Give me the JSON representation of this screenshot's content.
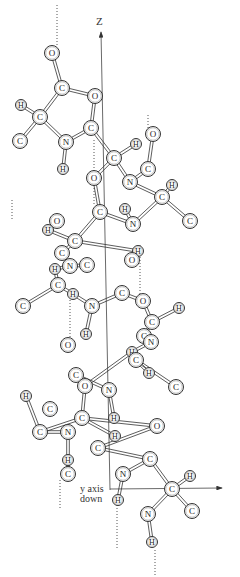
{
  "figure": {
    "type": "alpha-helix ball-and-stick diagram",
    "axes": {
      "z_label": "Z",
      "y_label_line1": "y axis",
      "y_label_line2": "down"
    }
  },
  "atoms": [
    {
      "el": "O",
      "x": 52,
      "y": 53
    },
    {
      "el": "C",
      "x": 62,
      "y": 88
    },
    {
      "el": "O",
      "x": 95,
      "y": 96
    },
    {
      "el": "H",
      "x": 21,
      "y": 105
    },
    {
      "el": "C",
      "x": 40,
      "y": 117
    },
    {
      "el": "C",
      "x": 20,
      "y": 141
    },
    {
      "el": "N",
      "x": 66,
      "y": 142
    },
    {
      "el": "C",
      "x": 91,
      "y": 128
    },
    {
      "el": "O",
      "x": 153,
      "y": 134
    },
    {
      "el": "H",
      "x": 136,
      "y": 144
    },
    {
      "el": "C",
      "x": 114,
      "y": 158
    },
    {
      "el": "C",
      "x": 148,
      "y": 169
    },
    {
      "el": "H",
      "x": 63,
      "y": 169
    },
    {
      "el": "O",
      "x": 94,
      "y": 178
    },
    {
      "el": "N",
      "x": 130,
      "y": 182
    },
    {
      "el": "H",
      "x": 172,
      "y": 185
    },
    {
      "el": "C",
      "x": 162,
      "y": 197
    },
    {
      "el": "C",
      "x": 100,
      "y": 212
    },
    {
      "el": "H",
      "x": 125,
      "y": 209
    },
    {
      "el": "C",
      "x": 190,
      "y": 221
    },
    {
      "el": "N",
      "x": 133,
      "y": 224
    },
    {
      "el": "O",
      "x": 57,
      "y": 221
    },
    {
      "el": "H",
      "x": 48,
      "y": 230
    },
    {
      "el": "C",
      "x": 75,
      "y": 241
    },
    {
      "el": "H",
      "x": 138,
      "y": 251
    },
    {
      "el": "C",
      "x": 62,
      "y": 253
    },
    {
      "el": "O",
      "x": 132,
      "y": 260
    },
    {
      "el": "N",
      "x": 70,
      "y": 266
    },
    {
      "el": "C",
      "x": 87,
      "y": 265
    },
    {
      "el": "H",
      "x": 55,
      "y": 269
    },
    {
      "el": "C",
      "x": 58,
      "y": 285
    },
    {
      "el": "H",
      "x": 73,
      "y": 294
    },
    {
      "el": "C",
      "x": 23,
      "y": 306
    },
    {
      "el": "C",
      "x": 122,
      "y": 293
    },
    {
      "el": "O",
      "x": 143,
      "y": 301
    },
    {
      "el": "N",
      "x": 92,
      "y": 306
    },
    {
      "el": "H",
      "x": 179,
      "y": 308
    },
    {
      "el": "C",
      "x": 152,
      "y": 322
    },
    {
      "el": "H",
      "x": 86,
      "y": 334
    },
    {
      "el": "C",
      "x": 144,
      "y": 336
    },
    {
      "el": "N",
      "x": 151,
      "y": 342
    },
    {
      "el": "O",
      "x": 68,
      "y": 345
    },
    {
      "el": "H",
      "x": 132,
      "y": 352
    },
    {
      "el": "C",
      "x": 136,
      "y": 360
    },
    {
      "el": "H",
      "x": 149,
      "y": 373
    },
    {
      "el": "C",
      "x": 176,
      "y": 387
    },
    {
      "el": "C",
      "x": 76,
      "y": 375
    },
    {
      "el": "O",
      "x": 85,
      "y": 386
    },
    {
      "el": "N",
      "x": 109,
      "y": 390
    },
    {
      "el": "H",
      "x": 26,
      "y": 396
    },
    {
      "el": "C",
      "x": 50,
      "y": 409
    },
    {
      "el": "C",
      "x": 82,
      "y": 418
    },
    {
      "el": "H",
      "x": 114,
      "y": 418
    },
    {
      "el": "C",
      "x": 40,
      "y": 432
    },
    {
      "el": "N",
      "x": 68,
      "y": 432
    },
    {
      "el": "H",
      "x": 115,
      "y": 436
    },
    {
      "el": "O",
      "x": 157,
      "y": 426
    },
    {
      "el": "C",
      "x": 98,
      "y": 448
    },
    {
      "el": "C",
      "x": 150,
      "y": 459
    },
    {
      "el": "H",
      "x": 68,
      "y": 460
    },
    {
      "el": "C",
      "x": 68,
      "y": 474
    },
    {
      "el": "N",
      "x": 123,
      "y": 474
    },
    {
      "el": "H",
      "x": 190,
      "y": 476
    },
    {
      "el": "C",
      "x": 172,
      "y": 489
    },
    {
      "el": "H",
      "x": 118,
      "y": 500
    },
    {
      "el": "C",
      "x": 192,
      "y": 511
    },
    {
      "el": "N",
      "x": 148,
      "y": 514
    },
    {
      "el": "H",
      "x": 152,
      "y": 542
    }
  ],
  "bonds": [
    [
      0,
      1
    ],
    [
      1,
      4
    ],
    [
      1,
      2
    ],
    [
      4,
      3
    ],
    [
      4,
      5
    ],
    [
      4,
      6
    ],
    [
      6,
      7
    ],
    [
      6,
      12
    ],
    [
      7,
      2
    ],
    [
      7,
      10
    ],
    [
      10,
      9
    ],
    [
      10,
      13
    ],
    [
      10,
      14
    ],
    [
      14,
      11
    ],
    [
      14,
      16
    ],
    [
      11,
      8
    ],
    [
      16,
      15
    ],
    [
      16,
      19
    ],
    [
      16,
      20
    ],
    [
      20,
      18
    ],
    [
      20,
      17
    ],
    [
      17,
      13
    ],
    [
      17,
      23
    ],
    [
      23,
      22
    ],
    [
      23,
      24
    ],
    [
      23,
      25
    ],
    [
      25,
      27
    ],
    [
      27,
      29
    ],
    [
      28,
      27
    ],
    [
      30,
      29
    ],
    [
      30,
      32
    ],
    [
      30,
      31
    ],
    [
      31,
      35
    ],
    [
      35,
      33
    ],
    [
      33,
      34
    ],
    [
      35,
      38
    ],
    [
      34,
      37
    ],
    [
      37,
      36
    ],
    [
      37,
      39
    ],
    [
      39,
      40
    ],
    [
      40,
      42
    ],
    [
      42,
      43
    ],
    [
      43,
      44
    ],
    [
      43,
      45
    ],
    [
      42,
      47
    ],
    [
      47,
      46
    ],
    [
      46,
      48
    ],
    [
      48,
      52
    ],
    [
      47,
      51
    ],
    [
      51,
      53
    ],
    [
      53,
      49
    ],
    [
      51,
      55
    ],
    [
      54,
      53
    ],
    [
      51,
      56
    ],
    [
      56,
      57
    ],
    [
      57,
      58
    ],
    [
      58,
      61
    ],
    [
      61,
      64
    ],
    [
      58,
      63
    ],
    [
      63,
      62
    ],
    [
      63,
      65
    ],
    [
      63,
      66
    ],
    [
      66,
      67
    ],
    [
      60,
      59
    ],
    [
      60,
      54
    ]
  ],
  "hbonds": [
    [
      [
        57,
        5
      ],
      [
        57,
        45
      ]
    ],
    [
      [
        12,
        200
      ],
      [
        12,
        220
      ]
    ],
    [
      [
        94,
        140
      ],
      [
        94,
        205
      ]
    ],
    [
      [
        148,
        115
      ],
      [
        148,
        132
      ]
    ],
    [
      [
        140,
        245
      ],
      [
        140,
        300
      ]
    ],
    [
      [
        70,
        300
      ],
      [
        70,
        345
      ]
    ],
    [
      [
        60,
        480
      ],
      [
        60,
        510
      ]
    ],
    [
      [
        117,
        505
      ],
      [
        117,
        550
      ]
    ],
    [
      [
        155,
        550
      ],
      [
        155,
        577
      ]
    ]
  ]
}
